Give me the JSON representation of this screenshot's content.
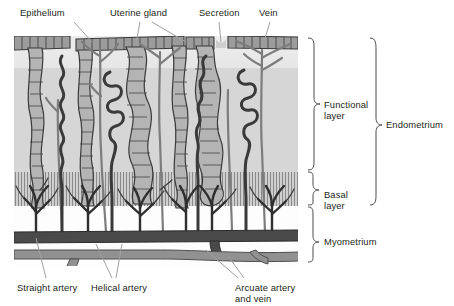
{
  "figure": {
    "type": "anatomical-diagram"
  },
  "colors": {
    "ink": "#231f20",
    "leader": "#9a9a9a",
    "functional_upper_band": "#ebebeb",
    "functional_mid_band": "#d4d4d4",
    "basal_band": "#c9c9c9",
    "basal_hatch": "#8d8d8d",
    "myometrium_band": "#ffffff",
    "epithelium_fill": "#9e9e9e",
    "gland_fill": "#b3b3b3",
    "artery_dark": "#3f3f3f",
    "vein_gray": "#808080",
    "arcuate_artery": "#555555",
    "arcuate_vein": "#8f8f8f",
    "background": "#ffffff"
  },
  "labels": {
    "top": [
      {
        "id": "epithelium",
        "text": "Epithelium",
        "x": 20,
        "y": 8
      },
      {
        "id": "uterine-gland",
        "text": "Uterine gland",
        "x": 110,
        "y": 8
      },
      {
        "id": "secretion",
        "text": "Secretion",
        "x": 199,
        "y": 8
      },
      {
        "id": "vein",
        "text": "Vein",
        "x": 259,
        "y": 8
      }
    ],
    "bottom": [
      {
        "id": "straight-artery",
        "text": "Straight artery",
        "x": 17,
        "y": 283
      },
      {
        "id": "helical-artery",
        "text": "Helical artery",
        "x": 91,
        "y": 283
      },
      {
        "id": "arcuate-artery-and-vein",
        "text": "Arcuate artery\nand vein",
        "x": 235,
        "y": 283
      }
    ],
    "right": [
      {
        "id": "functional-layer",
        "text": "Functional\nlayer",
        "x": 324,
        "y": 100
      },
      {
        "id": "basal-layer",
        "text": "Basal\nlayer",
        "x": 324,
        "y": 190
      },
      {
        "id": "myometrium",
        "text": "Myometrium",
        "x": 324,
        "y": 242
      },
      {
        "id": "endometrium",
        "text": "Endometrium",
        "x": 388,
        "y": 125
      }
    ]
  },
  "layers": [
    {
      "id": "functional-layer",
      "name": "Functional layer",
      "top": 36,
      "bottom": 172
    },
    {
      "id": "basal-layer",
      "name": "Basal layer",
      "top": 172,
      "bottom": 206
    },
    {
      "id": "myometrium",
      "name": "Myometrium",
      "top": 206,
      "bottom": 266
    }
  ],
  "brackets": [
    {
      "id": "bracket-functional-layer",
      "x": 312,
      "top": 38,
      "bottom": 170,
      "label": "Functional layer"
    },
    {
      "id": "bracket-basal-layer",
      "x": 312,
      "top": 172,
      "bottom": 205,
      "label": "Basal layer"
    },
    {
      "id": "bracket-myometrium",
      "x": 312,
      "top": 207,
      "bottom": 262,
      "label": "Myometrium"
    },
    {
      "id": "bracket-endometrium",
      "x": 376,
      "top": 38,
      "bottom": 205,
      "label": "Endometrium"
    }
  ],
  "structures": [
    {
      "id": "epithelium",
      "name": "Surface epithelium",
      "description": "segmented columnar cell layer along luminal surface"
    },
    {
      "id": "uterine-gland",
      "name": "Uterine gland",
      "description": "segmented tubular glands extending through functional layer"
    },
    {
      "id": "secretion",
      "name": "Secretion",
      "description": "gland contents discharging into uterine lumen"
    },
    {
      "id": "vein",
      "name": "Vein",
      "description": "gray branching venous channels"
    },
    {
      "id": "helical-artery",
      "name": "Helical artery",
      "description": "dark coiled spiral arteries in functional layer"
    },
    {
      "id": "straight-artery",
      "name": "Straight artery",
      "description": "short branches supplying basal layer"
    },
    {
      "id": "arcuate-artery-and-vein",
      "name": "Arcuate artery and vein",
      "description": "horizontal vessels within myometrium"
    }
  ]
}
